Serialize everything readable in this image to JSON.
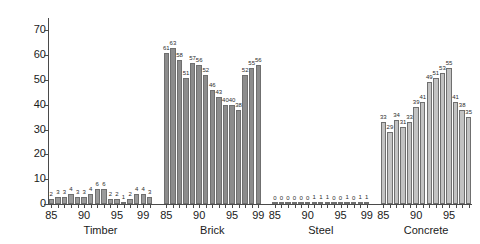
{
  "chart_data": {
    "type": "bar",
    "title": "",
    "xlabel": "",
    "ylabel": "",
    "ylim": [
      0,
      75
    ],
    "yticks": [
      0,
      10,
      20,
      30,
      40,
      50,
      60,
      70
    ],
    "grid": false,
    "legend": "none",
    "x": [
      "85",
      "86",
      "87",
      "88",
      "89",
      "90",
      "91",
      "92",
      "93",
      "94",
      "95",
      "96",
      "97",
      "98",
      "99"
    ],
    "xtick_labels_shown": [
      "85",
      "90",
      "95",
      "99"
    ],
    "groups": [
      {
        "name": "Timber",
        "color": "#9a9a9a",
        "values": [
          2,
          3,
          3,
          4,
          3,
          3,
          4,
          6,
          6,
          2,
          2,
          1,
          2,
          4,
          4,
          3
        ]
      },
      {
        "name": "Brick",
        "color": "#8c8c8c",
        "values": [
          61,
          63,
          58,
          51,
          57,
          56,
          52,
          46,
          43,
          40,
          40,
          38,
          52,
          55,
          56
        ]
      },
      {
        "name": "Steel",
        "color": "#9a9a9a",
        "values": [
          0,
          0,
          0,
          0,
          0,
          0,
          1,
          1,
          1,
          0,
          0,
          1,
          0,
          1,
          1
        ]
      },
      {
        "name": "Concrete",
        "color": "#c2c2c2",
        "values": [
          33,
          29,
          34,
          31,
          33,
          39,
          41,
          49,
          51,
          53,
          55,
          41,
          38,
          35
        ]
      }
    ]
  },
  "axis": {
    "y_tick_0": "0",
    "y_tick_10": "10",
    "y_tick_20": "20",
    "y_tick_30": "30",
    "y_tick_40": "40",
    "y_tick_50": "50",
    "y_tick_60": "60",
    "y_tick_70": "70"
  },
  "group_labels": {
    "timber": "Timber",
    "brick": "Brick",
    "steel": "Steel",
    "concrete": "Concrete"
  }
}
